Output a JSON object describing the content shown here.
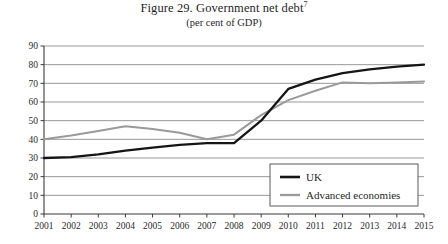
{
  "figure": {
    "title_main": "Figure 29. Government net debt",
    "title_footnote": "7",
    "subtitle": "(per cent of GDP)"
  },
  "colors": {
    "uk_line": "#151515",
    "advanced_line": "#9a9a9a",
    "gridline": "#8c8c8c",
    "axis": "#3a3a3a",
    "text": "#1f1f1f",
    "background": "#ffffff",
    "legend_border": "#5a5a5a"
  },
  "legend": {
    "position": "bottom-right",
    "items": [
      {
        "label": "UK",
        "color": "#151515"
      },
      {
        "label": "Advanced economies",
        "color": "#9a9a9a"
      }
    ]
  },
  "axes": {
    "y_ticks": [
      "0",
      "10",
      "20",
      "30",
      "40",
      "50",
      "60",
      "70",
      "80",
      "90"
    ],
    "x_ticks": [
      "2001",
      "2002",
      "2003",
      "2004",
      "2005",
      "2006",
      "2007",
      "2008",
      "2009",
      "2010",
      "2011",
      "2012",
      "2013",
      "2014",
      "2015"
    ]
  },
  "chart_data": {
    "type": "line",
    "title": "Figure 29. Government net debt",
    "subtitle": "(per cent of GDP)",
    "xlabel": "",
    "ylabel": "",
    "xlim": [
      2001,
      2015
    ],
    "ylim": [
      0,
      90
    ],
    "ytick_step": 10,
    "grid": true,
    "legend_position": "bottom-right",
    "categories": [
      "2001",
      "2002",
      "2003",
      "2004",
      "2005",
      "2006",
      "2007",
      "2008",
      "2009",
      "2010",
      "2011",
      "2012",
      "2013",
      "2014",
      "2015"
    ],
    "x": [
      2001,
      2002,
      2003,
      2004,
      2005,
      2006,
      2007,
      2008,
      2009,
      2010,
      2011,
      2012,
      2013,
      2014,
      2015
    ],
    "series": [
      {
        "name": "UK",
        "color": "#151515",
        "values": [
          30,
          30.5,
          32,
          34,
          35.5,
          37,
          38,
          38,
          50,
          67,
          72,
          75.5,
          77.5,
          79,
          80
        ]
      },
      {
        "name": "Advanced economies",
        "color": "#9a9a9a",
        "values": [
          40,
          42,
          44.5,
          47,
          45.5,
          43.5,
          40,
          42.5,
          53,
          61,
          66,
          70.5,
          70,
          70.5,
          71
        ]
      }
    ]
  }
}
